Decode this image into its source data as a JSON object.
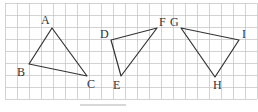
{
  "figure": {
    "grid": {
      "x0": 5,
      "y0": 3,
      "cell": 12,
      "cols": 21,
      "rows": 8,
      "line_color": "#c8c8c8",
      "border_color": "#bbbbbb"
    },
    "stroke_color": "#333333",
    "triangles": [
      {
        "name": "triangle-abc",
        "vertices": [
          {
            "label": "A",
            "x": 52,
            "y": 28,
            "lx": 41,
            "ly": 24
          },
          {
            "label": "B",
            "x": 29,
            "y": 64,
            "lx": 17,
            "ly": 76
          },
          {
            "label": "C",
            "x": 87,
            "y": 76,
            "lx": 87,
            "ly": 88
          }
        ]
      },
      {
        "name": "triangle-def",
        "vertices": [
          {
            "label": "D",
            "x": 111,
            "y": 40,
            "lx": 100,
            "ly": 38
          },
          {
            "label": "E",
            "x": 121,
            "y": 76,
            "lx": 113,
            "ly": 89
          },
          {
            "label": "F",
            "x": 157,
            "y": 28,
            "lx": 159,
            "ly": 26
          }
        ]
      },
      {
        "name": "triangle-ghi",
        "vertices": [
          {
            "label": "G",
            "x": 181,
            "y": 28,
            "lx": 170,
            "ly": 26
          },
          {
            "label": "H",
            "x": 215,
            "y": 77,
            "lx": 213,
            "ly": 89
          },
          {
            "label": "I",
            "x": 239,
            "y": 40,
            "lx": 242,
            "ly": 38
          }
        ]
      }
    ],
    "bottom_bar": {
      "x": 80,
      "y": 104,
      "w": 46,
      "h": 2,
      "color": "#d8d8d8"
    }
  }
}
